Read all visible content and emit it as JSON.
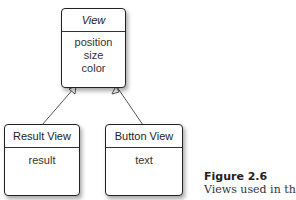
{
  "diagram": {
    "parent": {
      "title": "View",
      "attributes": [
        "position",
        "size",
        "color"
      ]
    },
    "children": [
      {
        "title": "Result View",
        "attributes": [
          "result"
        ]
      },
      {
        "title": "Button View",
        "attributes": [
          "text"
        ]
      }
    ],
    "relation": "inheritance"
  },
  "caption": {
    "number": "Figure 2.6",
    "text": "Views used in th"
  }
}
